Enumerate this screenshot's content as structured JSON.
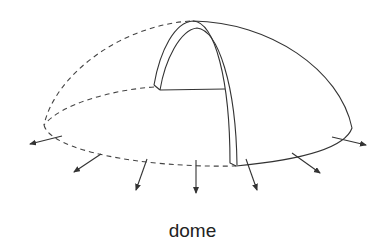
{
  "figure": {
    "label": "dome",
    "line_color": "#333333",
    "background": "#ffffff",
    "parts": {
      "dashed_outline": "hidden back edge of dome and base ellipse",
      "solid_outline": "visible dome surface edge",
      "arch": "cut-away arch section showing wall thickness",
      "arrows": 8
    }
  }
}
